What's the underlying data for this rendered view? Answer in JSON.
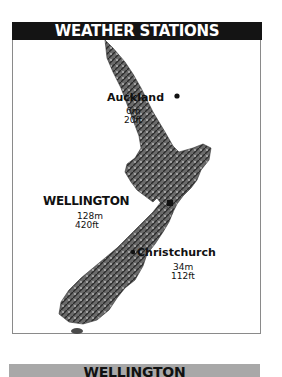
{
  "header": {
    "title": "WEATHER STATIONS"
  },
  "map": {
    "region": "New Zealand",
    "stations": [
      {
        "name": "Auckland",
        "elevation_m": "6m",
        "elevation_ft": "20ft",
        "marker": "dot"
      },
      {
        "name": "WELLINGTON",
        "elevation_m": "128m",
        "elevation_ft": "420ft",
        "marker": "square"
      },
      {
        "name": "Christchurch",
        "elevation_m": "34m",
        "elevation_ft": "112ft",
        "marker": "dot"
      }
    ]
  },
  "footer": {
    "title": "WELLINGTON"
  },
  "colors": {
    "header_bg": "#141414",
    "header_text": "#ffffff",
    "footer_bg": "#a8a8a8",
    "land": "#5a5a5a"
  }
}
